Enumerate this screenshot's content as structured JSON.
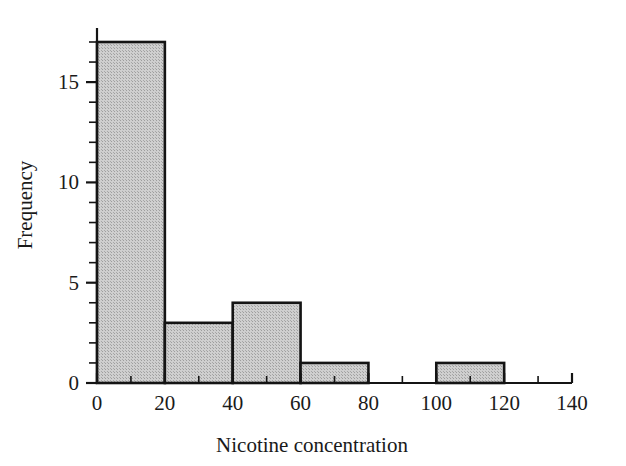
{
  "chart_data": {
    "type": "bar",
    "title": "",
    "xlabel": "Nicotine concentration",
    "ylabel": "Frequency",
    "bin_width": 20,
    "bin_edges": [
      0,
      20,
      40,
      60,
      80,
      100,
      120
    ],
    "categories": [
      "0-20",
      "20-40",
      "40-60",
      "60-80",
      "80-100",
      "100-120"
    ],
    "values": [
      17,
      3,
      4,
      1,
      0,
      1
    ],
    "xlim": [
      0,
      140
    ],
    "ylim": [
      0,
      17.6
    ],
    "x_ticks_major": [
      0,
      20,
      40,
      60,
      80,
      100,
      120,
      140
    ],
    "x_tick_labels": [
      "0",
      "20",
      "40",
      "60",
      "80",
      "100",
      "120",
      "140"
    ],
    "x_ticks_minor_step": 10,
    "y_ticks_major": [
      0,
      5,
      10,
      15
    ],
    "y_tick_labels": [
      "0",
      "5",
      "10",
      "15"
    ],
    "y_ticks_minor_step": 1,
    "grid": false,
    "legend": null,
    "bar_fill_color": "#c9c9c9",
    "bar_edge_color": "#141414",
    "axis_color": "#141414",
    "background_color": "#ffffff"
  },
  "axes": {
    "x_title": "Nicotine concentration",
    "y_title": "Frequency"
  }
}
